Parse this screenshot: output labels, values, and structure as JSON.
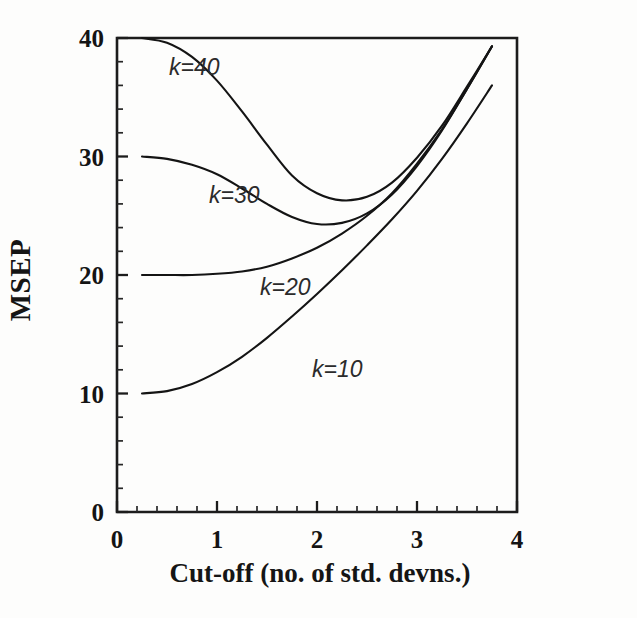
{
  "figure": {
    "background_color": "#fdfdfc",
    "ink_color": "#141414"
  },
  "chart_data": {
    "type": "line",
    "title": "",
    "subtitle": "",
    "xlabel": "Cut-off (no. of std. devns.)",
    "ylabel": "MSEP",
    "xlim": [
      0,
      4
    ],
    "ylim": [
      0,
      40
    ],
    "grid": false,
    "legend_position": "inline-curve-labels",
    "x_major_ticks": [
      0,
      1,
      2,
      3,
      4
    ],
    "x_tick_labels": [
      "0",
      "1",
      "2",
      "3",
      "4"
    ],
    "x_minor_tick_step": 0.2,
    "y_major_ticks": [
      0,
      10,
      20,
      30,
      40
    ],
    "y_tick_labels": [
      "0",
      "10",
      "20",
      "30",
      "40"
    ],
    "y_minor_tick_step": 2,
    "tick_direction": "in",
    "x": [
      0.25,
      0.5,
      0.75,
      1.0,
      1.25,
      1.5,
      1.75,
      2.0,
      2.25,
      2.5,
      2.75,
      3.0,
      3.25,
      3.5,
      3.75
    ],
    "series": [
      {
        "name": "k=40",
        "label": "k=40",
        "values": [
          40.0,
          39.6,
          38.4,
          36.4,
          33.8,
          31.0,
          28.4,
          26.9,
          26.3,
          26.6,
          27.8,
          29.9,
          32.6,
          35.9,
          39.3
        ]
      },
      {
        "name": "k=30",
        "label": "k=30",
        "values": [
          30.0,
          29.8,
          29.3,
          28.5,
          27.3,
          26.0,
          24.9,
          24.3,
          24.4,
          25.2,
          26.8,
          29.2,
          32.2,
          35.7,
          39.3
        ]
      },
      {
        "name": "k=20",
        "label": "k=20",
        "values": [
          20.0,
          20.0,
          20.0,
          20.1,
          20.3,
          20.7,
          21.4,
          22.3,
          23.5,
          25.0,
          26.9,
          29.4,
          32.3,
          35.7,
          39.3
        ]
      },
      {
        "name": "k=10",
        "label": "k=10",
        "values": [
          10.0,
          10.2,
          10.8,
          11.8,
          13.1,
          14.7,
          16.5,
          18.4,
          20.4,
          22.5,
          24.7,
          27.1,
          29.8,
          32.8,
          36.0
        ]
      }
    ],
    "annotations": [
      {
        "text": "k=40",
        "x": 0.52,
        "y": 36.9
      },
      {
        "text": "k=30",
        "x": 0.92,
        "y": 26.1
      },
      {
        "text": "k=20",
        "x": 1.43,
        "y": 18.3
      },
      {
        "text": "k=10",
        "x": 1.95,
        "y": 11.4
      }
    ]
  }
}
